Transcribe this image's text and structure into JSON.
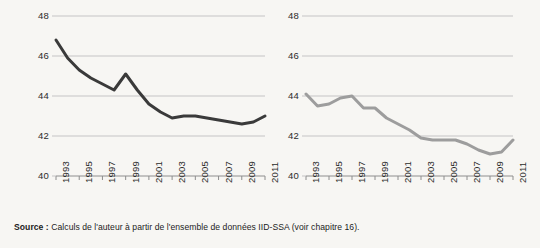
{
  "figure": {
    "background_color": "#f7f6f3",
    "source": {
      "label": "Source :",
      "text": "Calculs de l'auteur à partir de l'ensemble de données IID-SSA (voir chapitre 16)."
    }
  },
  "chart_data": [
    {
      "type": "line",
      "panel": "left",
      "title": "",
      "xlabel": "",
      "ylabel": "",
      "x": [
        1993,
        1994,
        1995,
        1996,
        1997,
        1998,
        1999,
        2000,
        2001,
        2002,
        2003,
        2004,
        2005,
        2006,
        2007,
        2008,
        2009,
        2010,
        2011
      ],
      "values": [
        46.8,
        45.9,
        45.3,
        44.9,
        44.6,
        44.3,
        45.1,
        44.3,
        43.6,
        43.2,
        42.9,
        43.0,
        43.0,
        42.9,
        42.8,
        42.7,
        42.6,
        42.7,
        43.0
      ],
      "series": [
        {
          "name": "Série gauche",
          "color": "#3a3a3a",
          "values": [
            46.8,
            45.9,
            45.3,
            44.9,
            44.6,
            44.3,
            45.1,
            44.3,
            43.6,
            43.2,
            42.9,
            43.0,
            43.0,
            42.9,
            42.8,
            42.7,
            42.6,
            42.7,
            43.0
          ]
        }
      ],
      "ylim": [
        40,
        48
      ],
      "yticks": [
        40,
        42,
        44,
        46,
        48
      ],
      "ytick_labels": [
        "40",
        "42",
        "44",
        "46",
        "48"
      ],
      "xticks": [
        1993,
        1995,
        1997,
        1999,
        2001,
        2003,
        2005,
        2007,
        2009,
        2011
      ],
      "xtick_labels": [
        "1993",
        "1995",
        "1997",
        "1999",
        "2001",
        "2003",
        "2005",
        "2007",
        "2009",
        "2011"
      ],
      "grid": true,
      "legend": false,
      "line_color": "#3a3a3a",
      "line_width": 3.0
    },
    {
      "type": "line",
      "panel": "right",
      "title": "",
      "xlabel": "",
      "ylabel": "",
      "x": [
        1993,
        1994,
        1995,
        1996,
        1997,
        1998,
        1999,
        2000,
        2001,
        2002,
        2003,
        2004,
        2005,
        2006,
        2007,
        2008,
        2009,
        2010,
        2011
      ],
      "values": [
        44.1,
        43.5,
        43.6,
        43.9,
        44.0,
        43.4,
        43.4,
        42.9,
        42.6,
        42.3,
        41.9,
        41.8,
        41.8,
        41.8,
        41.6,
        41.3,
        41.1,
        41.2,
        41.8
      ],
      "series": [
        {
          "name": "Série droite",
          "color": "#9d9d9d",
          "values": [
            44.1,
            43.5,
            43.6,
            43.9,
            44.0,
            43.4,
            43.4,
            42.9,
            42.6,
            42.3,
            41.9,
            41.8,
            41.8,
            41.8,
            41.6,
            41.3,
            41.1,
            41.2,
            41.8
          ]
        }
      ],
      "ylim": [
        40,
        48
      ],
      "yticks": [
        40,
        42,
        44,
        46,
        48
      ],
      "ytick_labels": [
        "40",
        "42",
        "44",
        "46",
        "48"
      ],
      "xticks": [
        1993,
        1995,
        1997,
        1999,
        2001,
        2003,
        2005,
        2007,
        2009,
        2011
      ],
      "xtick_labels": [
        "1993",
        "1995",
        "1997",
        "1999",
        "2001",
        "2003",
        "2005",
        "2007",
        "2009",
        "2011"
      ],
      "grid": true,
      "legend": false,
      "line_color": "#9d9d9d",
      "line_width": 3.0
    }
  ]
}
